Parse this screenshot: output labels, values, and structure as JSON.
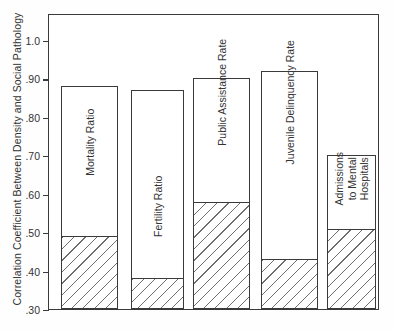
{
  "chart_data": {
    "type": "bar",
    "title": "",
    "xlabel": "",
    "ylabel": "Correlation Coefficient Between Density and Social Pathology",
    "ylim": [
      0.3,
      1.05
    ],
    "y_ticks": [
      1.0,
      0.9,
      0.8,
      0.7,
      0.6,
      0.5,
      0.4,
      0.3
    ],
    "y_tick_labels": [
      "1.0",
      ".90",
      ".80",
      ".70",
      ".60",
      ".50",
      ".40",
      ".30"
    ],
    "grid": false,
    "legend": "none",
    "categories": [
      "Mortality Ratio",
      "Fertility Ratio",
      "Public Assistance Rate",
      "Juvenile Delinquency Rate",
      "Admissions to Mental Hospitals"
    ],
    "series": [
      {
        "name": "Correlation with density (total bar height)",
        "values": [
          0.88,
          0.87,
          0.9,
          0.92,
          0.7
        ]
      },
      {
        "name": "Hatched lower portion (partial correlation)",
        "values": [
          0.49,
          0.38,
          0.58,
          0.43,
          0.51
        ]
      }
    ]
  },
  "axis": {
    "y_title": "Correlation Coefficient Between Density and Social Pathology",
    "ticks": [
      {
        "label": "1.0",
        "value": 1.0
      },
      {
        "label": ".90",
        "value": 0.9
      },
      {
        "label": ".80",
        "value": 0.8
      },
      {
        "label": ".70",
        "value": 0.7
      },
      {
        "label": ".60",
        "value": 0.6
      },
      {
        "label": ".50",
        "value": 0.5
      },
      {
        "label": ".40",
        "value": 0.4
      },
      {
        "label": ".30",
        "value": 0.3
      }
    ]
  },
  "bars": [
    {
      "label": "Mortality Ratio",
      "label_lines": "Mortality Ratio",
      "top": 0.88,
      "hatch_top": 0.49,
      "x": 60,
      "width": 57,
      "label_y": 122,
      "lines": 1
    },
    {
      "label": "Fertility Ratio",
      "label_lines": "Fertility Ratio",
      "top": 0.87,
      "hatch_top": 0.38,
      "x": 130,
      "width": 53,
      "label_y": 186,
      "lines": 1
    },
    {
      "label": "Public Assistance Rate",
      "label_lines": "Public Assistance Rate",
      "top": 0.9,
      "hatch_top": 0.58,
      "x": 192,
      "width": 57,
      "label_y": 72,
      "lines": 1
    },
    {
      "label": "Juvenile Delinquency Rate",
      "label_lines": "Juvenile Delinquency Rate",
      "top": 0.92,
      "hatch_top": 0.43,
      "x": 260,
      "width": 57,
      "label_y": 82,
      "lines": 1
    },
    {
      "label": "Admissions to Mental Hospitals",
      "label_lines": "Admissions\nto Mental\nHospitals",
      "top": 0.7,
      "hatch_top": 0.51,
      "x": 326,
      "width": 49,
      "label_y": 146,
      "lines": 3
    }
  ],
  "colors": {
    "frame": "#3a3a3a",
    "hatch": "#6e6e6e",
    "text": "#333333",
    "background": "#ffffff"
  }
}
